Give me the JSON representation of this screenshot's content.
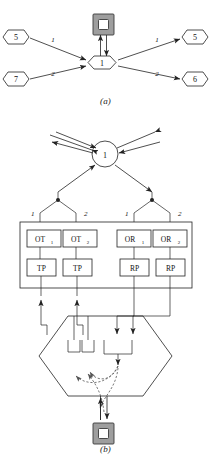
{
  "figure": {
    "caption_a": "(a)",
    "caption_b": "(b)"
  },
  "panel_a": {
    "center_node": "1",
    "terminal_icon": "nested-square-device-icon",
    "inputs": [
      {
        "node": "5",
        "edge_label": "1",
        "position": "upper-left"
      },
      {
        "node": "7",
        "edge_label": "2",
        "position": "lower-left"
      }
    ],
    "outputs": [
      {
        "node": "5",
        "edge_label": "1",
        "position": "upper-right"
      },
      {
        "node": "6",
        "edge_label": "2",
        "position": "lower-right"
      }
    ]
  },
  "panel_b": {
    "center_node": "1",
    "terminal_icon": "nested-square-device-icon",
    "port_labels": {
      "t1": "1",
      "t2": "2",
      "r1": "1",
      "r2": "2"
    },
    "transmit_group": [
      {
        "port": "OT",
        "port_sub": "1",
        "proc": "TP"
      },
      {
        "port": "OT",
        "port_sub": "2",
        "proc": "TP"
      }
    ],
    "receive_group": [
      {
        "port": "OR",
        "port_sub": "1",
        "proc": "RP"
      },
      {
        "port": "OR",
        "port_sub": "2",
        "proc": "RP"
      }
    ],
    "switch_shape": "hexagon-switch-fabric"
  },
  "colors": {
    "line": "#222222",
    "device_gray": "#9e9e9e",
    "dashed": "#555555",
    "background": "#ffffff"
  }
}
